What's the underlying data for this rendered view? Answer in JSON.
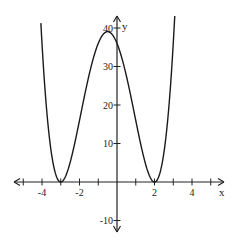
{
  "chart_data": {
    "type": "line",
    "title": "",
    "xlabel": "x",
    "ylabel": "y",
    "function": "y = (x+3)^2 (x-2)^2",
    "xlim": [
      -5.7,
      5.9
    ],
    "ylim": [
      -12,
      48
    ],
    "x_ticks": [
      -5,
      -4,
      -3,
      -2,
      -1,
      1,
      2,
      3,
      4,
      5
    ],
    "x_tick_labels": [
      {
        "value": -4,
        "label": "-4"
      },
      {
        "value": -2,
        "label": "-2"
      },
      {
        "value": 2,
        "label": "2"
      },
      {
        "value": 4,
        "label": "4"
      }
    ],
    "y_tick_labels": [
      {
        "value": 40,
        "label": "40"
      },
      {
        "value": 30,
        "label": "30"
      },
      {
        "value": 20,
        "label": "20"
      },
      {
        "value": 10,
        "label": "10"
      },
      {
        "value": -10,
        "label": "-10"
      }
    ],
    "key_points": [
      {
        "x": -3,
        "y": 0,
        "note": "local minimum / double root"
      },
      {
        "x": -0.5,
        "y": 39.06,
        "note": "local maximum"
      },
      {
        "x": 0,
        "y": 36,
        "note": "y-intercept"
      },
      {
        "x": 2,
        "y": 0,
        "note": "local minimum / double root"
      }
    ],
    "series": [
      {
        "name": "f(x)",
        "x": [
          -4.2,
          -4,
          -3.5,
          -3,
          -2.5,
          -2,
          -1.5,
          -1,
          -0.5,
          0,
          0.5,
          1,
          1.5,
          2,
          2.5,
          3,
          3.2
        ],
        "values": [
          54.8,
          36,
          7.56,
          0,
          5.06,
          16,
          27.56,
          36,
          39.06,
          36,
          27.56,
          16,
          5.06,
          0,
          7.56,
          36,
          54.8
        ]
      }
    ],
    "grid": false,
    "legend": null
  }
}
